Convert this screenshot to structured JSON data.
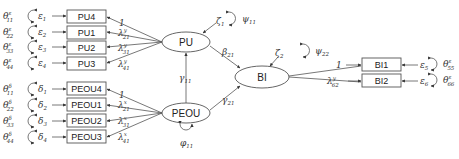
{
  "diagram": {
    "type": "structural-equation-model",
    "latent_variables": [
      {
        "id": "PU",
        "label": "PU",
        "disturbance": "ζ",
        "disturbance_sub": "1",
        "variance": "ψ",
        "variance_sub": "11"
      },
      {
        "id": "PEOU",
        "label": "PEOU",
        "variance": "φ",
        "variance_sub": "11"
      },
      {
        "id": "BI",
        "label": "BI",
        "disturbance": "ζ",
        "disturbance_sub": "2",
        "variance": "ψ",
        "variance_sub": "22"
      }
    ],
    "pu_indicators": [
      {
        "label": "PU4",
        "error": "ε",
        "error_sub": "1",
        "theta": "θ",
        "theta_sup": "ε",
        "theta_sub": "11",
        "loading": "1",
        "loading_sup": "",
        "loading_sub": ""
      },
      {
        "label": "PU1",
        "error": "ε",
        "error_sub": "2",
        "theta": "θ",
        "theta_sup": "ε",
        "theta_sub": "22",
        "loading": "λ",
        "loading_sup": "y",
        "loading_sub": "21"
      },
      {
        "label": "PU2",
        "error": "ε",
        "error_sub": "3",
        "theta": "θ",
        "theta_sup": "ε",
        "theta_sub": "33",
        "loading": "λ",
        "loading_sup": "y",
        "loading_sub": "31"
      },
      {
        "label": "PU3",
        "error": "ε",
        "error_sub": "4",
        "theta": "θ",
        "theta_sup": "ε",
        "theta_sub": "44",
        "loading": "λ",
        "loading_sup": "y",
        "loading_sub": "41"
      }
    ],
    "peou_indicators": [
      {
        "label": "PEOU4",
        "error": "δ",
        "error_sub": "1",
        "theta": "θ",
        "theta_sup": "δ",
        "theta_sub": "11",
        "loading": "1",
        "loading_sup": "",
        "loading_sub": ""
      },
      {
        "label": "PEOU1",
        "error": "δ",
        "error_sub": "2",
        "theta": "θ",
        "theta_sup": "δ",
        "theta_sub": "22",
        "loading": "λ",
        "loading_sup": "x",
        "loading_sub": "21"
      },
      {
        "label": "PEOU2",
        "error": "δ",
        "error_sub": "3",
        "theta": "θ",
        "theta_sup": "δ",
        "theta_sub": "33",
        "loading": "λ",
        "loading_sup": "x",
        "loading_sub": "31"
      },
      {
        "label": "PEOU3",
        "error": "δ",
        "error_sub": "4",
        "theta": "θ",
        "theta_sup": "δ",
        "theta_sub": "44",
        "loading": "λ",
        "loading_sup": "x",
        "loading_sub": "41"
      }
    ],
    "bi_indicators": [
      {
        "label": "BI1",
        "error": "ε",
        "error_sub": "5",
        "theta": "θ",
        "theta_sup": "ε",
        "theta_sub": "55",
        "loading": "1",
        "loading_sup": "",
        "loading_sub": ""
      },
      {
        "label": "BI2",
        "error": "ε",
        "error_sub": "6",
        "theta": "θ",
        "theta_sup": "ε",
        "theta_sub": "66",
        "loading": "λ",
        "loading_sup": "y",
        "loading_sub": "62"
      }
    ],
    "paths": [
      {
        "from": "PEOU",
        "to": "PU",
        "symbol": "γ",
        "sub": "11"
      },
      {
        "from": "PU",
        "to": "BI",
        "symbol": "β",
        "sub": "21"
      },
      {
        "from": "PEOU",
        "to": "BI",
        "symbol": "γ",
        "sub": "21"
      }
    ]
  }
}
